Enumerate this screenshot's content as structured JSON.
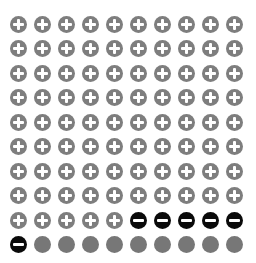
{
  "chart_data": {
    "type": "waffle",
    "title": "",
    "grid": {
      "rows": 10,
      "cols": 10
    },
    "categories": [
      "positive",
      "negative",
      "neutral"
    ],
    "values": [
      85,
      6,
      9
    ],
    "icons": {
      "positive": "plus-circle-icon",
      "negative": "minus-circle-icon",
      "neutral": "filled-circle-icon"
    },
    "colors": {
      "positive": "#7e7e7e",
      "negative": "#0a0a0a",
      "neutral": "#777777"
    },
    "fill_order": "row-major, top-left to bottom-right"
  }
}
